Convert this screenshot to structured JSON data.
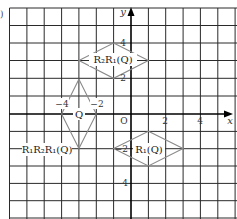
{
  "figure": {
    "part_label": ")",
    "axes": {
      "x_label": "x",
      "y_label": "y",
      "origin_label": "O",
      "x_range": [
        -7,
        6
      ],
      "y_range": [
        -6,
        6
      ],
      "x_ticks": [
        {
          "value": -4,
          "label": "−4"
        },
        {
          "value": -2,
          "label": "−2"
        },
        {
          "value": 2,
          "label": "2"
        },
        {
          "value": 4,
          "label": "4"
        }
      ],
      "y_ticks": [
        {
          "value": 4,
          "label": "4"
        },
        {
          "value": 2,
          "label": "2"
        },
        {
          "value": -2,
          "label": "−2"
        },
        {
          "value": -4,
          "label": "−4"
        }
      ]
    },
    "shapes": [
      {
        "name": "Q",
        "label": "Q",
        "vertices": [
          [
            -3,
            1
          ],
          [
            -2,
            -1
          ],
          [
            -3,
            -3
          ],
          [
            -4,
            -1
          ]
        ]
      },
      {
        "name": "R1(Q)",
        "label": "R₁(Q)",
        "vertices": [
          [
            1,
            -2
          ],
          [
            3,
            -3
          ],
          [
            1,
            -4
          ],
          [
            -1,
            -3
          ]
        ]
      },
      {
        "name": "R2R1(Q)",
        "label": "R₂R₁(Q)",
        "vertices": [
          [
            -1,
            4
          ],
          [
            1,
            3
          ],
          [
            -1,
            2
          ],
          [
            -3,
            3
          ]
        ]
      },
      {
        "name": "R1R2R1(Q)",
        "label": "R₁R₂R₁(Q)",
        "note": "same as Q"
      }
    ],
    "colors": {
      "grid": "#2a2a2a",
      "shape_stroke": "#8a8a8a",
      "axis": "#000000"
    }
  }
}
